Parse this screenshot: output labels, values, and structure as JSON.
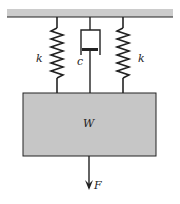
{
  "diagram": {
    "type": "mass-spring-damper",
    "labels": {
      "spring_left": "k",
      "spring_right": "k",
      "damper": "c",
      "mass": "W",
      "force": "F"
    },
    "colors": {
      "ceiling": "#c8c8c8",
      "mass_fill": "#c4c4c4",
      "line": "#222222"
    }
  }
}
